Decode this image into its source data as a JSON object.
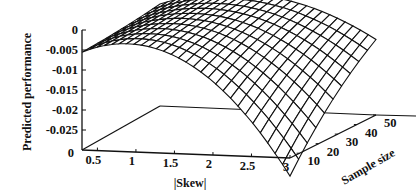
{
  "chart_data": {
    "type": "surface3d",
    "title": "",
    "xlabel": "|Skew|",
    "ylabel": "Sample size",
    "zlabel": "Predicted performance",
    "x_ticks": [
      "0.5",
      "1",
      "1.5",
      "2",
      "2.5",
      "3"
    ],
    "y_ticks": [
      "10",
      "20",
      "30",
      "40",
      "50"
    ],
    "z_ticks": [
      "0",
      "-0.005",
      "-0.01",
      "-0.015",
      "-0.02",
      "-0.025"
    ],
    "z_floor_label": "0",
    "xlim": [
      0.3,
      3.0
    ],
    "ylim": [
      5,
      50
    ],
    "zlim": [
      -0.03,
      0
    ],
    "grid_x_count": 28,
    "grid_y_count": 10,
    "surface_description": "Concave-down surface; approx -0.0055 at |Skew|=0.3, peaking near -0.001 around |Skew|~1.2 at large sample size, falling to about -0.028 at |Skew|=3 with sample size 5 and about -0.011 at |Skew|=3 with sample size 50",
    "sample_points": [
      {
        "x": 0.3,
        "y": 5,
        "z": -0.0055
      },
      {
        "x": 0.3,
        "y": 50,
        "z": -0.0045
      },
      {
        "x": 1.2,
        "y": 50,
        "z": -0.001
      },
      {
        "x": 3.0,
        "y": 50,
        "z": -0.011
      },
      {
        "x": 3.0,
        "y": 5,
        "z": -0.028
      }
    ]
  }
}
